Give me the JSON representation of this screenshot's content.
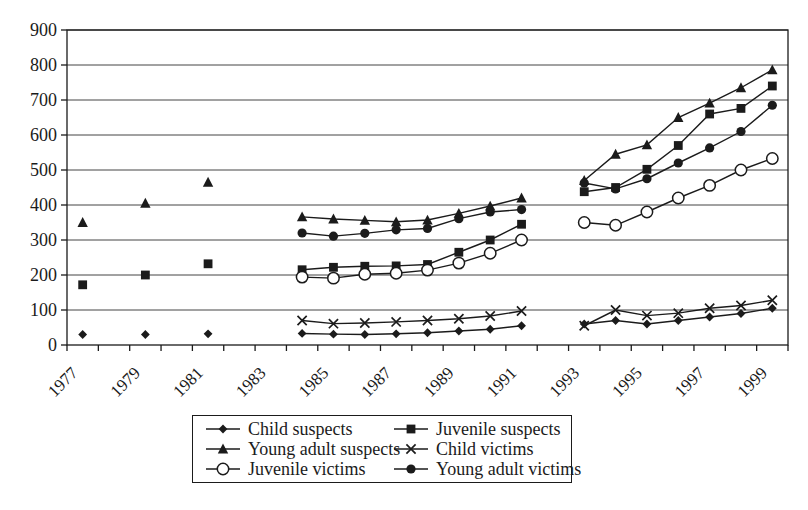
{
  "colors": {
    "background": "#ffffff",
    "ink": "#1b1b1b",
    "grid": "#444444"
  },
  "chart_data": {
    "type": "line",
    "title": "",
    "xlabel": "",
    "ylabel": "",
    "legend_position": "bottom",
    "grid": "horizontal",
    "y_axis": {
      "min": 0,
      "max": 900,
      "step": 100,
      "tick_labels": [
        "0",
        "100",
        "200",
        "300",
        "400",
        "500",
        "600",
        "700",
        "800",
        "900"
      ]
    },
    "x_axis": {
      "tick_labels": [
        "1977",
        "1979",
        "1981",
        "1983",
        "1985",
        "1987",
        "1989",
        "1991",
        "1993",
        "1995",
        "1997",
        "1999"
      ],
      "labeled_years": [
        1977,
        1979,
        1981,
        1983,
        1985,
        1987,
        1989,
        1991,
        1993,
        1995,
        1997,
        1999
      ],
      "minor_ticks": "yearly 1977-1999"
    },
    "sections": [
      {
        "years": [
          1977,
          1979,
          1981
        ],
        "connect": false
      },
      {
        "years": [
          1984,
          1985,
          1986,
          1987,
          1988,
          1989,
          1990,
          1991
        ],
        "connect": true
      },
      {
        "years": [
          1993,
          1994,
          1995,
          1996,
          1997,
          1998,
          1999
        ],
        "connect": true
      }
    ],
    "series": [
      {
        "name": "Child suspects",
        "marker": "diamond",
        "values": [
          [
            30,
            30,
            32
          ],
          [
            33,
            31,
            30,
            32,
            35,
            40,
            45,
            55
          ],
          [
            60,
            70,
            60,
            70,
            80,
            90,
            105
          ]
        ]
      },
      {
        "name": "Juvenile suspects",
        "marker": "square",
        "values": [
          [
            172,
            200,
            232
          ],
          [
            215,
            222,
            225,
            226,
            230,
            265,
            300,
            345
          ],
          [
            438,
            450,
            502,
            570,
            660,
            676,
            740
          ]
        ]
      },
      {
        "name": "Young adult suspects",
        "marker": "triangle",
        "values": [
          [
            350,
            405,
            465
          ],
          [
            366,
            360,
            356,
            352,
            357,
            376,
            397,
            420
          ],
          [
            470,
            545,
            572,
            650,
            691,
            735,
            786
          ]
        ]
      },
      {
        "name": "Child victims",
        "marker": "x",
        "values": [
          null,
          [
            70,
            61,
            63,
            66,
            70,
            75,
            83,
            97
          ],
          [
            55,
            100,
            84,
            91,
            105,
            113,
            128
          ]
        ]
      },
      {
        "name": "Juvenile victims",
        "marker": "circle-open",
        "values": [
          null,
          [
            194,
            191,
            202,
            205,
            214,
            234,
            262,
            300
          ],
          [
            350,
            342,
            380,
            420,
            456,
            500,
            533
          ]
        ]
      },
      {
        "name": "Young adult victims",
        "marker": "circle-filled",
        "values": [
          null,
          [
            320,
            311,
            319,
            329,
            333,
            361,
            380,
            387
          ],
          [
            463,
            446,
            475,
            520,
            563,
            610,
            685
          ]
        ]
      }
    ]
  }
}
